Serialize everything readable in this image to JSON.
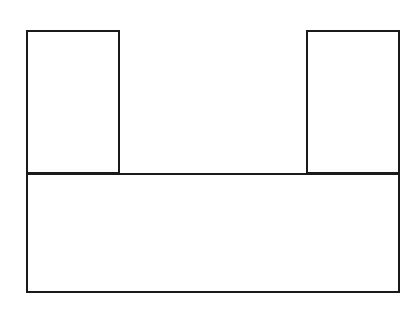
{
  "diagram": {
    "background": "#ffffff",
    "stroke_color": "#1a1a1a",
    "stroke_width": 2,
    "shapes": [
      {
        "id": "left-upper-block",
        "type": "rect",
        "x": 26,
        "y": 30,
        "width": 94,
        "height": 144
      },
      {
        "id": "right-upper-block",
        "type": "rect",
        "x": 306,
        "y": 30,
        "width": 94,
        "height": 144
      },
      {
        "id": "base-block",
        "type": "rect",
        "x": 26,
        "y": 173,
        "width": 374,
        "height": 120
      }
    ]
  }
}
